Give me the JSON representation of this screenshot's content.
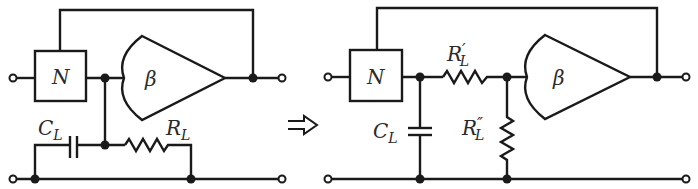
{
  "figure": {
    "arrow": "double-arrow-right",
    "colors": {
      "line": "#1a1a1a",
      "background": "#ffffff",
      "text": "#2a2a2a"
    }
  },
  "left_circuit": {
    "network_label": "N",
    "amplifier_label": "β",
    "capacitor": {
      "symbol": "C",
      "subscript": "L"
    },
    "resistor": {
      "symbol": "R",
      "subscript": "L"
    }
  },
  "right_circuit": {
    "network_label": "N",
    "amplifier_label": "β",
    "capacitor": {
      "symbol": "C",
      "subscript": "L"
    },
    "series_resistor": {
      "symbol": "R",
      "prime": "′",
      "subscript": "L"
    },
    "shunt_resistor": {
      "symbol": "R",
      "prime": "″",
      "subscript": "L"
    }
  }
}
